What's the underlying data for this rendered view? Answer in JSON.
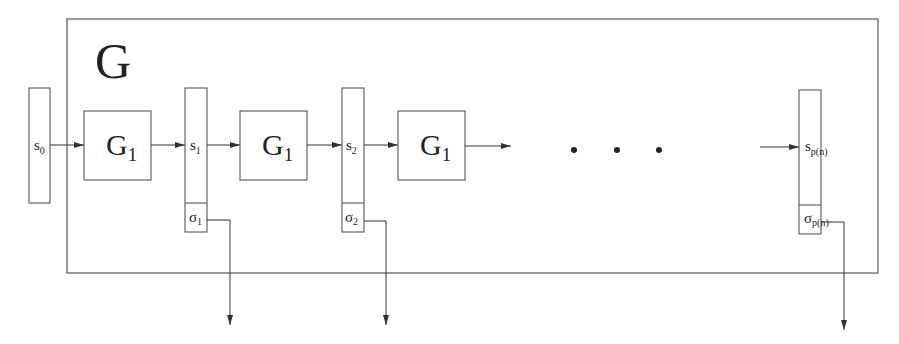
{
  "title": "G",
  "colors": {
    "stroke": "#555555",
    "text": "#222222",
    "background": "#ffffff"
  },
  "outer_box": {
    "label": "G"
  },
  "generator_blocks": [
    {
      "label": "G",
      "subscript": "1"
    },
    {
      "label": "G",
      "subscript": "1"
    },
    {
      "label": "G",
      "subscript": "1"
    }
  ],
  "states": [
    {
      "label": "s",
      "subscript": "0"
    },
    {
      "label": "s",
      "subscript": "1"
    },
    {
      "label": "s",
      "subscript": "2"
    },
    {
      "label": "s",
      "subscript": "p(n)"
    }
  ],
  "outputs": [
    {
      "label": "σ",
      "subscript": "1"
    },
    {
      "label": "σ",
      "subscript": "2"
    },
    {
      "label": "σ",
      "subscript": "p(n)"
    }
  ],
  "ellipsis": "• • •"
}
